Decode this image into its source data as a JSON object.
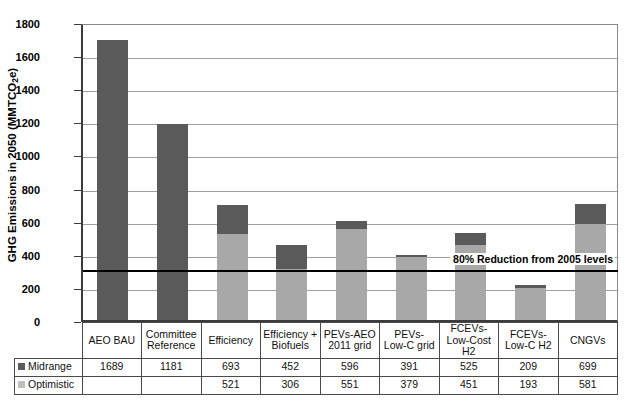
{
  "chart_data": {
    "type": "bar",
    "subtype": "stacked-comparison",
    "title": "",
    "xlabel": "",
    "ylabel": "GHG Emissions in 2050 (MMTCO2e)",
    "ylabel_parts": {
      "before": "GHG Emissions in 2050 (MMTCO",
      "sub": "2",
      "after": "e)"
    },
    "ylim": [
      0,
      1800
    ],
    "ytick_step": 200,
    "yticks": [
      0,
      200,
      400,
      600,
      800,
      1000,
      1200,
      1400,
      1600,
      1800
    ],
    "ytick_labels": [
      "0",
      "200",
      "400",
      "600",
      "800",
      "1000",
      "1200",
      "1400",
      "1600",
      "1800"
    ],
    "grid": true,
    "legend_position": "table-row-headers",
    "categories": [
      "AEO BAU",
      "Committee Reference",
      "Efficiency",
      "Efficiency + Biofuels",
      "PEVs-AEO 2011 grid",
      "PEVs-Low-C grid",
      "FCEVs-Low-Cost H2",
      "FCEVs-Low-C H2",
      "CNGVs"
    ],
    "series": [
      {
        "name": "Midrange",
        "color": "#5a5a5a",
        "values": [
          1689,
          1181,
          693,
          452,
          596,
          391,
          525,
          209,
          699
        ]
      },
      {
        "name": "Optimistic",
        "color": "#a8a8a8",
        "values": [
          null,
          null,
          521,
          306,
          551,
          379,
          451,
          193,
          581
        ]
      }
    ],
    "annotations": [
      {
        "type": "hline",
        "label": "80% Reduction from 2005 levels",
        "value": 320,
        "color": "#000000"
      }
    ]
  },
  "table": {
    "column_headers": [
      "AEO BAU",
      "Committee Reference",
      "Efficiency",
      "Efficiency + Biofuels",
      "PEVs-AEO 2011 grid",
      "PEVs-Low-C grid",
      "FCEVs-Low-Cost H2",
      "FCEVs-Low-C H2",
      "CNGVs"
    ],
    "column_headers_wrapped": [
      [
        "AEO BAU",
        ""
      ],
      [
        "Committee",
        "Reference"
      ],
      [
        "Efficiency",
        ""
      ],
      [
        "Efficiency +",
        "Biofuels"
      ],
      [
        "PEVs-AEO",
        "2011 grid"
      ],
      [
        "PEVs-",
        "Low-C grid"
      ],
      [
        "FCEVs-",
        "Low-Cost H2"
      ],
      [
        "FCEVs-",
        "Low-C H2"
      ],
      [
        "CNGVs",
        ""
      ]
    ],
    "rows": [
      {
        "label": "Midrange",
        "swatch": "dark",
        "values": [
          "1689",
          "1181",
          "693",
          "452",
          "596",
          "391",
          "525",
          "209",
          "699"
        ]
      },
      {
        "label": "Optimistic",
        "swatch": "light",
        "values": [
          "",
          "",
          "521",
          "306",
          "551",
          "379",
          "451",
          "193",
          "581"
        ]
      }
    ]
  },
  "colors": {
    "midrange": "#5a5a5a",
    "optimistic": "#a8a8a8",
    "grid": "#9d9d9d",
    "axis": "#3b3b3b",
    "target_line": "#000000"
  }
}
